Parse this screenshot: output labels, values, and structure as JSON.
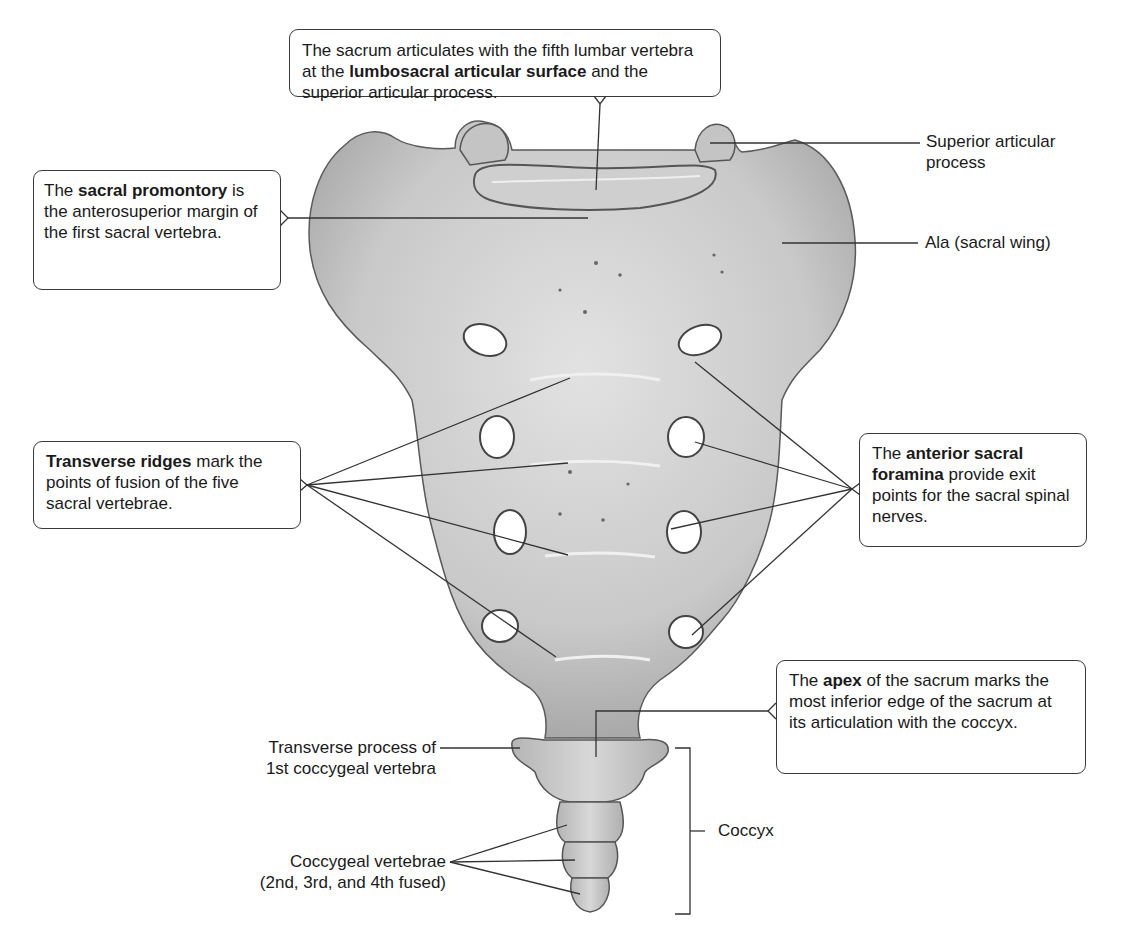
{
  "figure": {
    "colors": {
      "bone_fill": "#c8c8c8",
      "bone_highlight": "#e4e4e4",
      "bone_shadow": "#8a8a8a",
      "leader_lines": "#333333",
      "callout_border": "#3a3a3a",
      "background": "#ffffff"
    }
  },
  "callouts": {
    "lumbosacral": {
      "pre": "The sacrum articulates with the fifth lumbar vertebra at the ",
      "bold": "lumbosacral articular surface",
      "post": " and the superior articular process."
    },
    "promontory": {
      "pre": "The ",
      "bold": "sacral promontory",
      "post": " is the anterosuperior margin of the first sacral vertebra."
    },
    "ridges": {
      "pre": "",
      "bold": "Transverse ridges",
      "post": " mark the points of fusion of the five sacral vertebrae."
    },
    "foramina": {
      "pre": "The ",
      "bold": "anterior sacral foramina",
      "post": " provide exit points for the sacral spinal nerves."
    },
    "apex": {
      "pre": "The ",
      "bold": "apex",
      "post": " of the sacrum marks the most inferior edge of the sacrum at its articulation with the coccyx."
    }
  },
  "labels": {
    "superior_articular_process_1": "Superior articular",
    "superior_articular_process_2": "process",
    "ala": "Ala (sacral wing)",
    "transverse_process_1": "Transverse process of",
    "transverse_process_2": "1st coccygeal vertebra",
    "coccygeal_vertebrae_1": "Coccygeal vertebrae",
    "coccygeal_vertebrae_2": "(2nd, 3rd, and 4th fused)",
    "coccyx": "Coccyx"
  }
}
